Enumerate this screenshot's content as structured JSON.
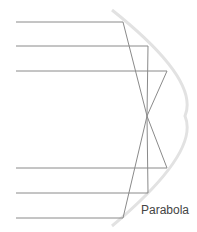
{
  "diagram": {
    "label": "Parabola",
    "colors": {
      "ray": "#8a8a8a",
      "parabola": "#e2e2e2",
      "text": "#444444"
    },
    "focus": {
      "x": 147,
      "y": 116
    },
    "rays": [
      {
        "y": 22,
        "hit_x": 123
      },
      {
        "y": 46,
        "hit_x": 148
      },
      {
        "y": 71,
        "hit_x": 167
      },
      {
        "y": 168,
        "hit_x": 167
      },
      {
        "y": 193,
        "hit_x": 148
      },
      {
        "y": 218,
        "hit_x": 123
      }
    ]
  }
}
